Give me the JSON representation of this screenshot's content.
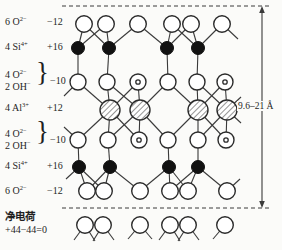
{
  "ion_labels": [
    {
      "species": "6 O",
      "sup": "2−",
      "charge": "−12"
    },
    {
      "species": "4 Si",
      "sup": "4+",
      "charge": "+16"
    },
    {
      "line1": "4 O",
      "line1_sup": "2−",
      "line2": "2 OH",
      "line2_sup": "−",
      "brace": "}",
      "charge": "−10"
    },
    {
      "species": "4 Al",
      "sup": "3+",
      "charge": "+12"
    },
    {
      "line1": "4 O",
      "line1_sup": "2−",
      "line2": "2 OH",
      "line2_sup": "−",
      "brace": "}",
      "charge": "−10"
    },
    {
      "species": "4 Si",
      "sup": "4+",
      "charge": "+16"
    },
    {
      "species": "6 O",
      "sup": "2−",
      "charge": "−12"
    }
  ],
  "net_charge": {
    "title": "净电荷",
    "equation": "+44−44=0"
  },
  "dimension": {
    "label": "9.6–21 Å"
  },
  "structure": {
    "stroke": "#3a3a3a",
    "dashed_lines": [
      {
        "x1": 62,
        "y1": 6,
        "x2": 271,
        "y2": 6
      },
      {
        "x1": 62,
        "y1": 208,
        "x2": 271,
        "y2": 208
      }
    ],
    "arrow": {
      "x": 262,
      "y1": 6,
      "y2": 208
    },
    "rows": [
      {
        "name": "oxygen-top",
        "type": "O",
        "y": 24,
        "r": 8.3,
        "xs": [
          84,
          106,
          138,
          172,
          191,
          222
        ]
      },
      {
        "name": "silicon-top",
        "type": "Si",
        "y": 48,
        "r": 6.5,
        "xs": [
          78,
          109,
          167,
          198
        ]
      },
      {
        "name": "oxygen-hydroxyl-upper",
        "type": "O",
        "y": 82,
        "r": 8,
        "xs": [
          78,
          107,
          138,
          168,
          197,
          225
        ],
        "oh": [
          2,
          5
        ]
      },
      {
        "name": "aluminium",
        "type": "Al",
        "y": 110,
        "r": 10,
        "xs": [
          110,
          140,
          198,
          227
        ]
      },
      {
        "name": "oxygen-hydroxyl-lower",
        "type": "O",
        "y": 140,
        "r": 8,
        "xs": [
          78,
          108,
          139,
          168,
          198,
          226
        ],
        "oh": [
          2,
          5
        ]
      },
      {
        "name": "silicon-bottom",
        "type": "Si",
        "y": 167,
        "r": 6.5,
        "xs": [
          79,
          110,
          169,
          198
        ]
      },
      {
        "name": "oxygen-bottom",
        "type": "O",
        "y": 191,
        "r": 8.3,
        "xs": [
          87,
          104,
          140,
          170,
          188,
          227
        ]
      },
      {
        "name": "oxygen-next-layer",
        "type": "O",
        "y": 225,
        "r": 8.3,
        "xs": [
          85,
          103,
          140,
          170,
          188,
          225
        ]
      }
    ],
    "bonds": [
      [
        1,
        0,
        0,
        0
      ],
      [
        1,
        0,
        0,
        1
      ],
      [
        1,
        1,
        0,
        0
      ],
      [
        1,
        1,
        0,
        1
      ],
      [
        1,
        1,
        0,
        2
      ],
      [
        1,
        2,
        0,
        2
      ],
      [
        1,
        2,
        0,
        3
      ],
      [
        1,
        2,
        0,
        4
      ],
      [
        1,
        3,
        0,
        3
      ],
      [
        1,
        3,
        0,
        4
      ],
      [
        1,
        3,
        0,
        5
      ],
      [
        1,
        0,
        2,
        0
      ],
      [
        1,
        1,
        2,
        1
      ],
      [
        1,
        2,
        2,
        3
      ],
      [
        1,
        3,
        2,
        4
      ],
      [
        3,
        0,
        2,
        0
      ],
      [
        3,
        0,
        2,
        1
      ],
      [
        3,
        0,
        2,
        2
      ],
      [
        3,
        1,
        2,
        1
      ],
      [
        3,
        1,
        2,
        2
      ],
      [
        3,
        1,
        2,
        3
      ],
      [
        3,
        2,
        2,
        3
      ],
      [
        3,
        2,
        2,
        4
      ],
      [
        3,
        2,
        2,
        5
      ],
      [
        3,
        3,
        2,
        4
      ],
      [
        3,
        3,
        2,
        5
      ],
      [
        3,
        0,
        4,
        0
      ],
      [
        3,
        0,
        4,
        1
      ],
      [
        3,
        0,
        4,
        2
      ],
      [
        3,
        1,
        4,
        1
      ],
      [
        3,
        1,
        4,
        2
      ],
      [
        3,
        1,
        4,
        3
      ],
      [
        3,
        2,
        4,
        3
      ],
      [
        3,
        2,
        4,
        4
      ],
      [
        3,
        2,
        4,
        5
      ],
      [
        3,
        3,
        4,
        4
      ],
      [
        3,
        3,
        4,
        5
      ],
      [
        5,
        0,
        4,
        0
      ],
      [
        5,
        1,
        4,
        1
      ],
      [
        5,
        2,
        4,
        3
      ],
      [
        5,
        3,
        4,
        4
      ],
      [
        5,
        0,
        6,
        0
      ],
      [
        5,
        0,
        6,
        1
      ],
      [
        5,
        1,
        6,
        0
      ],
      [
        5,
        1,
        6,
        1
      ],
      [
        5,
        1,
        6,
        2
      ],
      [
        5,
        2,
        6,
        2
      ],
      [
        5,
        2,
        6,
        3
      ],
      [
        5,
        2,
        6,
        4
      ],
      [
        5,
        3,
        6,
        3
      ],
      [
        5,
        3,
        6,
        4
      ],
      [
        5,
        3,
        6,
        5
      ]
    ],
    "stubs": [
      [
        0,
        5,
        16,
        15
      ],
      [
        2,
        0,
        -14,
        14
      ],
      [
        4,
        0,
        -14,
        -13
      ],
      [
        3,
        3,
        14,
        -13
      ],
      [
        3,
        3,
        14,
        13
      ],
      [
        5,
        0,
        -13,
        12
      ],
      [
        6,
        5,
        13,
        -12
      ],
      [
        7,
        0,
        -11,
        15
      ],
      [
        7,
        0,
        10,
        16
      ],
      [
        7,
        1,
        -10,
        16
      ],
      [
        7,
        1,
        11,
        15
      ],
      [
        7,
        2,
        -12,
        14
      ],
      [
        7,
        2,
        12,
        14
      ],
      [
        7,
        3,
        -11,
        15
      ],
      [
        7,
        3,
        10,
        16
      ],
      [
        7,
        4,
        -10,
        16
      ],
      [
        7,
        4,
        11,
        15
      ],
      [
        7,
        5,
        -12,
        14
      ]
    ]
  }
}
